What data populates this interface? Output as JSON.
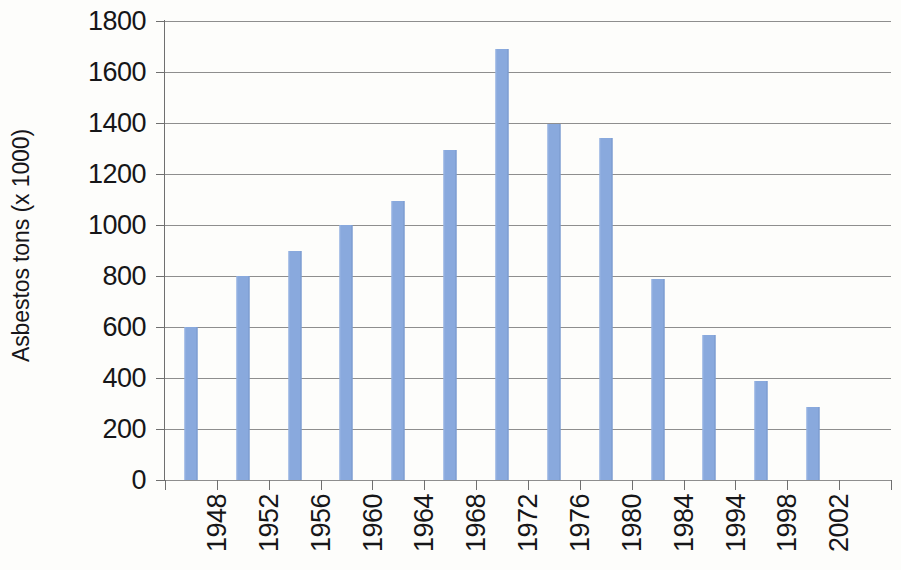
{
  "chart_data": {
    "type": "bar",
    "title": "",
    "subtitle": "",
    "xlabel": "",
    "ylabel": "Asbestos tons (x 1000)",
    "categories": [
      "1948",
      "1952",
      "1956",
      "1960",
      "1964",
      "1968",
      "1972",
      "1976",
      "1980",
      "1984",
      "1994",
      "1998",
      "2002"
    ],
    "values": [
      600,
      800,
      900,
      1000,
      1095,
      1295,
      1690,
      1395,
      1340,
      790,
      570,
      390,
      285
    ],
    "series": [
      {
        "name": "Asbestos tons (x 1000)",
        "values": [
          600,
          800,
          900,
          1000,
          1095,
          1295,
          1690,
          1395,
          1340,
          790,
          570,
          390,
          285
        ]
      }
    ],
    "ylim": [
      0,
      1800
    ],
    "ytick_labels": [
      "0",
      "200",
      "400",
      "600",
      "800",
      "1000",
      "1200",
      "1400",
      "1600",
      "1800"
    ],
    "ytick_values": [
      0,
      200,
      400,
      600,
      800,
      1000,
      1200,
      1400,
      1600,
      1800
    ],
    "ytick_interval": 200,
    "grid": true,
    "grid_axis": "y",
    "legend": false,
    "legend_position": "none",
    "bar_color": "#89a9dd",
    "gridline_color": "#8e8e8e",
    "axis_color": "#6f6f6f",
    "background_color": "#fdfdfb",
    "text_color": "#161618",
    "xtick_rotation": -90,
    "trailing_empty_slot": true,
    "annotations": []
  }
}
